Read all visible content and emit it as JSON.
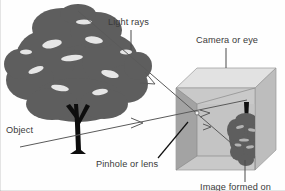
{
  "figure": {
    "background_color": "#fefefe"
  },
  "labels": {
    "light_rays": "Light rays",
    "camera_or_eye": "Camera or eye",
    "object": "Object",
    "pinhole_or_lens": "Pinhole or lens",
    "image_formed_on": "Image formed on"
  },
  "colors": {
    "text": "#3a3a3a",
    "ray_line": "#5a5a5a",
    "pinhole_line": "#111111",
    "leader_line": "#4a4a4a",
    "tree_canopy": "#5e5e5e",
    "tree_trunk": "#0d0d0d",
    "cube_top_face": "#e2e2e2",
    "cube_left_face": "#9e9e9e",
    "cube_front_face": "#c9c9c9",
    "cube_right_face": "#bdbdbd",
    "cube_edge": "#8a8a8a",
    "image_canopy": "#5e5e5e",
    "image_trunk": "#111111"
  },
  "diagram_elements": {
    "object_tree": {
      "name": "tree",
      "canopy_center": [
        78,
        70
      ],
      "trunk_base": [
        80,
        152
      ],
      "orientation": "upright"
    },
    "camera_box": {
      "name": "cube",
      "front_top_left": [
        176,
        88
      ],
      "front_bottom_right": [
        255,
        170
      ],
      "perspective": "isometric-ish, top and right faces visible"
    },
    "pinhole_point": [
      197,
      113
    ],
    "formed_image": {
      "name": "inverted-tree",
      "canopy_center": [
        243,
        135
      ],
      "trunk_top": [
        246,
        104
      ],
      "orientation": "inverted"
    },
    "rays": [
      {
        "from": [
          78,
          12
        ],
        "to": [
          238,
          148
        ],
        "arrow_at": [
          150,
          82
        ],
        "description": "ray from top of object to bottom of image"
      },
      {
        "from": [
          22,
          146
        ],
        "to": [
          246,
          100
        ],
        "arrow_at": [
          140,
          122
        ],
        "description": "ray from base of object to top of image"
      }
    ]
  }
}
